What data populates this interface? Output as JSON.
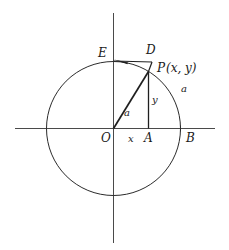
{
  "figure": {
    "kind": "geometry-diagram",
    "background_color": "#ffffff",
    "stroke_color": "#2b2b2b",
    "axis_color": "#4a4a4a",
    "label_color": "#1a1a1a",
    "labels": {
      "origin": "O",
      "point_p": "P",
      "point_p_coords": "(x, y)",
      "point_a": "A",
      "point_b": "B",
      "point_d": "D",
      "point_e": "E",
      "seg_x": "x",
      "seg_y": "y",
      "radius_inner": "a",
      "radius_outer": "a"
    },
    "geometry": {
      "center": [
        113.5,
        128.5
      ],
      "radius": 67,
      "point_p": [
        148.5,
        71.5
      ],
      "point_a": [
        148.5,
        128.5
      ],
      "point_b": [
        180.5,
        128.5
      ],
      "point_e": [
        113.5,
        61.5
      ],
      "point_d": [
        151.5,
        62.0
      ],
      "x_axis": [
        15,
        128.5,
        215,
        128.5
      ],
      "y_axis": [
        113.5,
        13,
        113.5,
        243
      ]
    }
  }
}
